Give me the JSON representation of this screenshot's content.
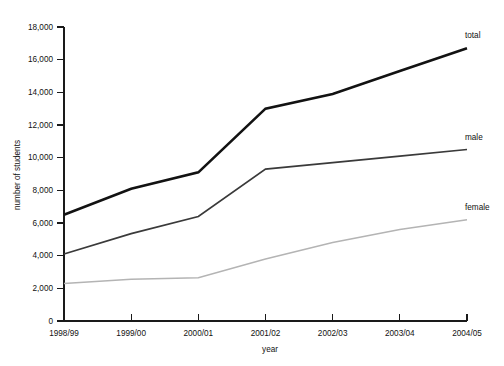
{
  "figure": {
    "cropped_header_text": "",
    "background_color": "#ffffff"
  },
  "chart_data": {
    "type": "line",
    "title": "",
    "subtitle": "",
    "xlabel": "year",
    "ylabel": "number of students",
    "categories": [
      "1998/99",
      "1999/00",
      "2000/01",
      "2001/02",
      "2002/03",
      "2003/04",
      "2004/05"
    ],
    "series": [
      {
        "name": "total",
        "color": "#121212",
        "label": "total",
        "values": [
          6500,
          8100,
          9100,
          13000,
          13900,
          15300,
          16700
        ]
      },
      {
        "name": "male",
        "color": "#3a3a3a",
        "label": "male",
        "values": [
          4100,
          5350,
          6400,
          9300,
          9700,
          10100,
          10500
        ]
      },
      {
        "name": "female",
        "color": "#b4b4b4",
        "label": "female",
        "values": [
          2300,
          2550,
          2650,
          3800,
          4800,
          5600,
          6200
        ]
      }
    ],
    "ylim": [
      0,
      18000
    ],
    "ytick_values": [
      0,
      2000,
      4000,
      6000,
      8000,
      10000,
      12000,
      14000,
      16000,
      18000
    ],
    "ytick_labels": [
      "0",
      "2,000",
      "4,000",
      "6,000",
      "8,000",
      "10,000",
      "12,000",
      "14,000",
      "16,000",
      "18,000"
    ],
    "grid": false,
    "legend_position": "right-inline-labels"
  }
}
